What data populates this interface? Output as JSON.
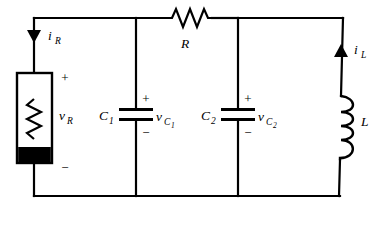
{
  "figure": {
    "name": "rlc-parallel-circuit",
    "background_color": "#ffffff",
    "line_color": "#000000"
  },
  "components": {
    "resistor_variable": {
      "symbol_name": "variable-resistor-box",
      "voltage_label": "v",
      "voltage_subscript": "R",
      "polarity_top": "+",
      "polarity_bottom": "−",
      "branch": "left"
    },
    "resistor_series": {
      "symbol_name": "resistor-zigzag",
      "label": "R",
      "branch": "top"
    },
    "capacitor_1": {
      "symbol_name": "capacitor-plates",
      "label": "C",
      "label_subscript": "1",
      "voltage_label": "v",
      "voltage_subscript": "C₁",
      "voltage_sub_main": "C",
      "voltage_sub_index": "1",
      "polarity_top": "+",
      "polarity_bottom": "−",
      "branch": "middle-left"
    },
    "capacitor_2": {
      "symbol_name": "capacitor-plates",
      "label": "C",
      "label_subscript": "2",
      "voltage_label": "v",
      "voltage_sub_main": "C",
      "voltage_sub_index": "2",
      "polarity_top": "+",
      "polarity_bottom": "−",
      "branch": "middle-right"
    },
    "inductor": {
      "symbol_name": "inductor-coil",
      "label": "L",
      "coil_count": 4,
      "branch": "right"
    }
  },
  "currents": {
    "i_R": {
      "label": "i",
      "subscript": "R",
      "direction": "down",
      "arrow_name": "current-arrow-down"
    },
    "i_L": {
      "label": "i",
      "subscript": "L",
      "direction": "up",
      "arrow_name": "current-arrow-up"
    }
  },
  "labels": {
    "i_R_main": "i",
    "i_R_sub": "R",
    "i_L_main": "i",
    "i_L_sub": "L",
    "v_R_main": "v",
    "v_R_sub": "R",
    "R_main": "R",
    "C1_main": "C",
    "C1_sub": "1",
    "C2_main": "C",
    "C2_sub": "2",
    "L_main": "L",
    "vC1_main": "v",
    "vC1_sub_c": "C",
    "vC1_sub_n": "1",
    "vC2_main": "v",
    "vC2_sub_c": "C",
    "vC2_sub_n": "2",
    "plus_left": "+",
    "minus_left": "−",
    "plus_c1": "+",
    "minus_c1": "−",
    "plus_c2": "+",
    "minus_c2": "−"
  }
}
